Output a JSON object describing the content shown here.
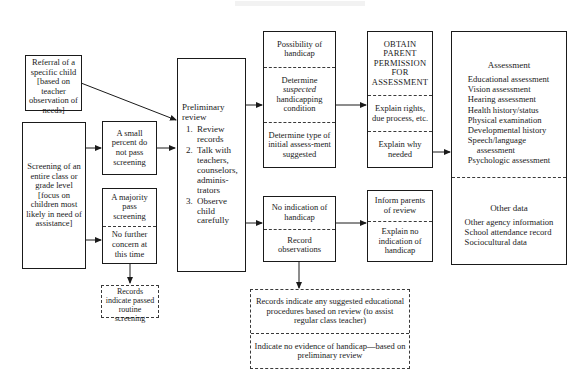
{
  "diagram": {
    "boxes": {
      "referral": {
        "text": "Referral of a specific child [based on teacher observation of needs]"
      },
      "screening": {
        "text": "Screening of an entire class or grade level [focus on children most likely in need of assistance]"
      },
      "small_percent": {
        "text": "A small percent do not pass screening"
      },
      "majority": {
        "cell1": "A majority pass screening",
        "cell2": "No further concern at this time"
      },
      "records_passed": {
        "text": "Records indicate passed routine screening"
      },
      "preliminary": {
        "heading": "Preliminary review",
        "steps": [
          "Review records",
          "Talk with teachers, counselors, adminis-trators",
          "Observe child carefully"
        ]
      },
      "possibility": {
        "cell1": "Possibility of handicap",
        "cell2_pre": "Determine",
        "cell2_ital": "suspected",
        "cell2_post": "handicapping condition",
        "cell3": "Determine type of initial assess-ment suggested"
      },
      "obtain_permission": {
        "cell1": "OBTAIN PARENT PERMISSION FOR ASSESSMENT",
        "cell2": "Explain rights, due process, etc.",
        "cell3": "Explain why needed"
      },
      "no_indication": {
        "cell1": "No indication of handicap",
        "cell2": "Record observations"
      },
      "inform_parents": {
        "cell1": "Inform parents of review",
        "cell2": "Explain no indication of handicap"
      },
      "assessment": {
        "title": "Assessment",
        "items": [
          "Educational assessment",
          "Vision assessment",
          "Hearing assessment",
          "Health history/status",
          "Physical examination",
          "Developmental history",
          "Speech/language",
          "assessment",
          "Psychologic assessment"
        ],
        "other_title": "Other data",
        "other_items": [
          "Other agency information",
          "School attendance record",
          "Sociocultural data"
        ]
      },
      "records_suggested": {
        "cell1": "Records indicate any suggested educational procedures based on review (to assist regular class teacher)",
        "cell2": "Indicate no evidence of handicap—based on preliminary review"
      }
    },
    "colors": {
      "ink": "#1a1a1a",
      "dashed": "#3a3a3a",
      "background": "#ffffff"
    }
  }
}
